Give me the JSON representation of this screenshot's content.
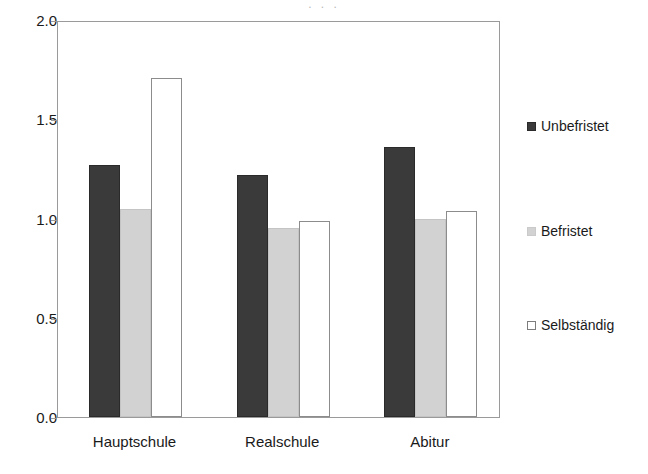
{
  "figure": {
    "background_color": "#ffffff",
    "top_crop_remnant": ". . ."
  },
  "chart_data": {
    "type": "bar",
    "title": "",
    "subtitle": "",
    "xlabel": "",
    "ylabel": "",
    "categories": [
      "Hauptschule",
      "Realschule",
      "Abitur"
    ],
    "series": [
      {
        "name": "Unbefristet",
        "color": "#3a3a3a",
        "values": [
          1.27,
          1.22,
          1.36
        ]
      },
      {
        "name": "Befristet",
        "color": "#d2d2d2",
        "values": [
          1.05,
          0.95,
          1.0
        ]
      },
      {
        "name": "Selbständig",
        "color": "#ffffff",
        "values": [
          1.71,
          0.99,
          1.04
        ]
      }
    ],
    "ylim": [
      0.0,
      2.0
    ],
    "ytick_labels": [
      "0.0",
      "0.5",
      "1.0",
      "1.5",
      "2.0"
    ],
    "ytick_values": [
      0.0,
      0.5,
      1.0,
      1.5,
      2.0
    ],
    "grid": false,
    "legend_position": "right",
    "axis_color": "#9a9a9a"
  },
  "legend": {
    "entries": [
      {
        "label": "Unbefristet",
        "swatch": "filled-dark-square-icon"
      },
      {
        "label": "Befristet",
        "swatch": "filled-light-gray-square-icon"
      },
      {
        "label": "Selbständig",
        "swatch": "outlined-white-square-icon"
      }
    ]
  }
}
